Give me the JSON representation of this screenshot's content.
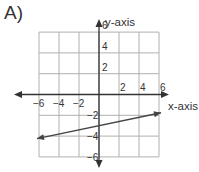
{
  "problem_label": "A)",
  "chart_data": {
    "type": "line",
    "title": "",
    "xlabel": "x-axis",
    "ylabel": "y-axis",
    "xlim": [
      -6,
      6
    ],
    "ylim": [
      -6,
      6
    ],
    "grid": true,
    "grid_step": 2,
    "x_tick_labels": [
      "-6",
      "-4",
      "-2",
      "2",
      "4",
      "6"
    ],
    "y_tick_labels": [
      "6",
      "4",
      "2",
      "-2",
      "-4",
      "-6"
    ],
    "series": [
      {
        "name": "line",
        "equation": "y = (1/5)x - 3",
        "x": [
          -6.2,
          6.2
        ],
        "y": [
          -4.24,
          -1.76
        ],
        "arrows_both_ends": true
      }
    ]
  },
  "colors": {
    "grid": "#b0b0b0",
    "axis": "#333333",
    "line": "#444444"
  }
}
